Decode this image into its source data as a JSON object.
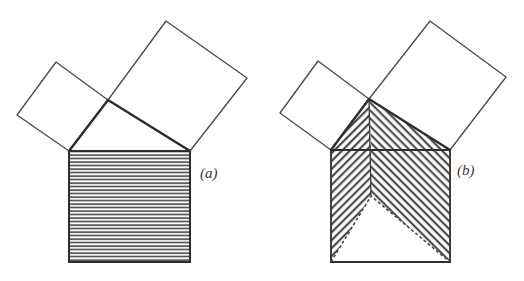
{
  "figure": {
    "background_color": "#ffffff",
    "ink_color": "#3b3b3b",
    "panels": [
      {
        "id": "panel-a",
        "label": "(a)",
        "label_position": {
          "x": 200,
          "y": 178
        },
        "description": "Right triangle with squares on all three sides; the square on the hypotenuse is filled with horizontal hatching.",
        "triangle": {
          "name": "right-triangle",
          "vertices": [
            {
              "x": 69,
              "y": 151
            },
            {
              "x": 190,
              "y": 151
            },
            {
              "x": 108,
              "y": 100
            }
          ]
        },
        "squares": [
          {
            "name": "square-on-hypotenuse",
            "hatch": "horizontal",
            "hatch_spacing": 3.5,
            "vertices": [
              {
                "x": 69,
                "y": 151
              },
              {
                "x": 190,
                "y": 151
              },
              {
                "x": 190,
                "y": 262
              },
              {
                "x": 69,
                "y": 262
              }
            ]
          },
          {
            "name": "square-on-short-leg",
            "hatch": "none",
            "vertices": [
              {
                "x": 69,
                "y": 151
              },
              {
                "x": 108,
                "y": 100
              },
              {
                "x": 56,
                "y": 62
              },
              {
                "x": 17,
                "y": 115
              }
            ]
          },
          {
            "name": "square-on-long-leg",
            "hatch": "none",
            "vertices": [
              {
                "x": 108,
                "y": 100
              },
              {
                "x": 190,
                "y": 151
              },
              {
                "x": 247,
                "y": 78
              },
              {
                "x": 166,
                "y": 21
              }
            ]
          }
        ]
      },
      {
        "id": "panel-b",
        "label": "(b)",
        "label_position": {
          "x": 457,
          "y": 175
        },
        "description": "Same configuration with the two leg squares sheared into the hypotenuse square; diagonal hatching shows the rearranged area with a triangular notch at the bottom.",
        "triangle": {
          "name": "right-triangle",
          "vertices": [
            {
              "x": 331,
              "y": 150
            },
            {
              "x": 450,
              "y": 150
            },
            {
              "x": 369,
              "y": 99
            }
          ]
        },
        "squares": [
          {
            "name": "square-on-hypotenuse",
            "hatch": "diagonal",
            "hatch_spacing": 4.0,
            "vertices": [
              {
                "x": 331,
                "y": 150
              },
              {
                "x": 450,
                "y": 150
              },
              {
                "x": 450,
                "y": 262
              },
              {
                "x": 331,
                "y": 262
              }
            ]
          },
          {
            "name": "square-on-short-leg",
            "hatch": "none",
            "vertices": [
              {
                "x": 331,
                "y": 150
              },
              {
                "x": 369,
                "y": 99
              },
              {
                "x": 318,
                "y": 61
              },
              {
                "x": 280,
                "y": 113
              }
            ]
          },
          {
            "name": "square-on-long-leg",
            "hatch": "none",
            "vertices": [
              {
                "x": 369,
                "y": 99
              },
              {
                "x": 450,
                "y": 150
              },
              {
                "x": 506,
                "y": 77
              },
              {
                "x": 430,
                "y": 21
              }
            ]
          }
        ],
        "notch": {
          "name": "triangular-notch",
          "fill": "#ffffff",
          "edge_style": "dashed",
          "vertices": [
            {
              "x": 331,
              "y": 262
            },
            {
              "x": 371,
              "y": 196
            },
            {
              "x": 450,
              "y": 262
            }
          ]
        },
        "fold_line": {
          "name": "center-fold-line",
          "from": {
            "x": 369,
            "y": 99
          },
          "to": {
            "x": 371,
            "y": 196
          }
        }
      }
    ]
  }
}
